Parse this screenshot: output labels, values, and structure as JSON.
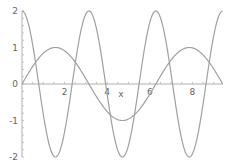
{
  "chart_data": {
    "type": "line",
    "title": "",
    "xlabel": "x",
    "ylabel": "",
    "xlim": [
      0,
      9.42
    ],
    "ylim": [
      -2,
      2
    ],
    "grid": false,
    "legend": null,
    "x_ticks": [
      2,
      4,
      6,
      8
    ],
    "y_ticks": [
      2,
      1,
      0,
      -1,
      -2
    ],
    "x_tick_labels": [
      "2",
      "4",
      "6",
      "8"
    ],
    "y_tick_labels": [
      "2",
      "1",
      "0",
      "-1",
      "-2"
    ],
    "series": [
      {
        "name": "sin(x)",
        "color": "#a0a0a0",
        "x": [
          0,
          0.785,
          1.571,
          2.356,
          3.142,
          3.927,
          4.712,
          5.498,
          6.283,
          7.069,
          7.854,
          8.639,
          9.425
        ],
        "values": [
          0,
          0.71,
          1,
          0.71,
          0,
          -0.71,
          -1,
          -0.71,
          0,
          0.71,
          1,
          0.71,
          0
        ]
      },
      {
        "name": "2cos(2x)",
        "color": "#a0a0a0",
        "x": [
          0,
          0.785,
          1.571,
          2.356,
          3.142,
          3.927,
          4.712,
          5.498,
          6.283,
          7.069,
          7.854,
          8.639,
          9.425
        ],
        "values": [
          2,
          0,
          -2,
          0,
          2,
          0,
          -2,
          0,
          2,
          0,
          -2,
          0,
          2
        ]
      }
    ]
  },
  "axes": {
    "x_label": "x",
    "x_ticks": [
      "2",
      "4",
      "6",
      "8"
    ],
    "y_ticks": [
      "2",
      "1",
      "0",
      "-1",
      "-2"
    ]
  }
}
